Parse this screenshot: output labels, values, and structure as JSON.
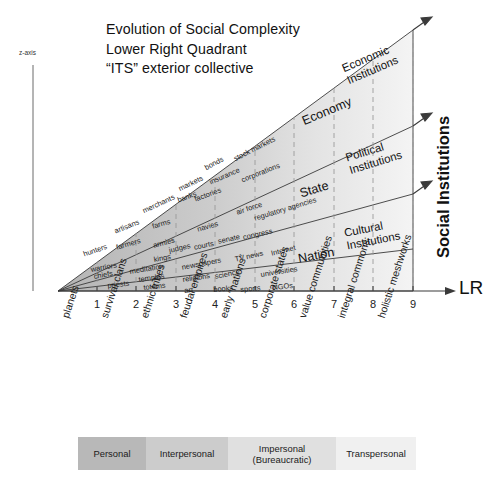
{
  "title": {
    "line1": "Evolution of Social Complexity",
    "line2": "Lower Right Quadrant",
    "line3": "“ITS” exterior collective"
  },
  "axes": {
    "z_label": "z-axis",
    "x_label": "LR",
    "y_label": "Social Institutions",
    "ticks": [
      "1",
      "2",
      "3",
      "4",
      "5",
      "6",
      "7",
      "8",
      "9"
    ],
    "tick_categories": [
      "planets",
      "survival clans",
      "ethnic tribes",
      "feudal empires",
      "early “nations”",
      "corporate states",
      "value communities",
      "integral commons",
      "holistic meshworks"
    ]
  },
  "bands": [
    {
      "name": "Economy",
      "institution_label_line1": "Economic",
      "institution_label_line2": "Institutions",
      "items": [
        "markets",
        "banks",
        "bonds",
        "insurance",
        "stock markets",
        "factories",
        "corporations"
      ]
    },
    {
      "name": "State",
      "institution_label_line1": "Political",
      "institution_label_line2": "Institutions",
      "items": [
        "armies",
        "kings",
        "judges",
        "courts",
        "navies",
        "senate",
        "congress",
        "air force",
        "regulatory agencies"
      ]
    },
    {
      "name": "Nation",
      "institution_label_line1": "Cultural",
      "institution_label_line2": "Institutions",
      "items": [
        "newspapers",
        "religions",
        "art",
        "books",
        "science",
        "sports",
        "TV news",
        "universities",
        "Internet",
        "NGOs"
      ]
    }
  ],
  "early_items": [
    "hunters",
    "warriors",
    "chiefs",
    "priests",
    "artisans",
    "farmers",
    "meditation",
    "temples",
    "totems",
    "merchants",
    "farms"
  ],
  "cells": [
    {
      "text": "hunters",
      "x": 82,
      "y": 250,
      "rot": -19
    },
    {
      "text": "warriors",
      "x": 90,
      "y": 265,
      "rot": -10
    },
    {
      "text": "chiefs",
      "x": 93,
      "y": 272,
      "rot": -10
    },
    {
      "text": "priests",
      "x": 107,
      "y": 281,
      "rot": -6
    },
    {
      "text": "artisans",
      "x": 113,
      "y": 227,
      "rot": -22
    },
    {
      "text": "farmers",
      "x": 115,
      "y": 243,
      "rot": -16
    },
    {
      "text": "meditation",
      "x": 129,
      "y": 267,
      "rot": -9
    },
    {
      "text": "temples",
      "x": 138,
      "y": 275,
      "rot": -8
    },
    {
      "text": "totems",
      "x": 143,
      "y": 283,
      "rot": -6
    },
    {
      "text": "merchants",
      "x": 141,
      "y": 207,
      "rot": -25
    },
    {
      "text": "farms",
      "x": 151,
      "y": 222,
      "rot": -16
    },
    {
      "text": "armies",
      "x": 152,
      "y": 241,
      "rot": -14
    },
    {
      "text": "kings",
      "x": 153,
      "y": 255,
      "rot": -10
    },
    {
      "text": "judges",
      "x": 168,
      "y": 246,
      "rot": -13
    },
    {
      "text": "markets",
      "x": 177,
      "y": 185,
      "rot": -26
    },
    {
      "text": "banks",
      "x": 176,
      "y": 196,
      "rot": -20
    },
    {
      "text": "factories",
      "x": 193,
      "y": 195,
      "rot": -20
    },
    {
      "text": "navies",
      "x": 196,
      "y": 225,
      "rot": -16
    },
    {
      "text": "courts",
      "x": 193,
      "y": 243,
      "rot": -12
    },
    {
      "text": "newspapers",
      "x": 181,
      "y": 263,
      "rot": -11
    },
    {
      "text": "religions",
      "x": 182,
      "y": 275,
      "rot": -8
    },
    {
      "text": "art",
      "x": 184,
      "y": 286,
      "rot": -5
    },
    {
      "text": "bonds",
      "x": 203,
      "y": 164,
      "rot": -28
    },
    {
      "text": "insurance",
      "x": 208,
      "y": 178,
      "rot": -23
    },
    {
      "text": "senate",
      "x": 217,
      "y": 237,
      "rot": -13
    },
    {
      "text": "science",
      "x": 214,
      "y": 272,
      "rot": -11
    },
    {
      "text": "books",
      "x": 213,
      "y": 285,
      "rot": -5
    },
    {
      "text": "stock markets",
      "x": 232,
      "y": 155,
      "rot": -27
    },
    {
      "text": "corporations",
      "x": 240,
      "y": 176,
      "rot": -22
    },
    {
      "text": "air force",
      "x": 235,
      "y": 208,
      "rot": -18
    },
    {
      "text": "congress",
      "x": 242,
      "y": 233,
      "rot": -13
    },
    {
      "text": "TV news",
      "x": 234,
      "y": 255,
      "rot": -13
    },
    {
      "text": "sports",
      "x": 240,
      "y": 285,
      "rot": -5
    },
    {
      "text": "regulatory agencies",
      "x": 253,
      "y": 214,
      "rot": -17
    },
    {
      "text": "Internet",
      "x": 270,
      "y": 249,
      "rot": -14
    },
    {
      "text": "universities",
      "x": 260,
      "y": 270,
      "rot": -9
    },
    {
      "text": "NGOs",
      "x": 272,
      "y": 283,
      "rot": -6
    }
  ],
  "legend": {
    "segments": [
      {
        "label1": "Personal",
        "label2": "",
        "color": "#b8b8b8",
        "width": 68
      },
      {
        "label1": "Interpersonal",
        "label2": "",
        "color": "#cccccc",
        "width": 82
      },
      {
        "label1": "Impersonal",
        "label2": "(Bureaucratic)",
        "color": "#e0e0e0",
        "width": 108
      },
      {
        "label1": "Transpersonal",
        "label2": "",
        "color": "#f0f0f0",
        "width": 80
      }
    ]
  },
  "colors": {
    "fill_dark": "#b9b9b9",
    "fill_light": "#f2f2f2",
    "line": "#333333",
    "dash": "#999999"
  }
}
